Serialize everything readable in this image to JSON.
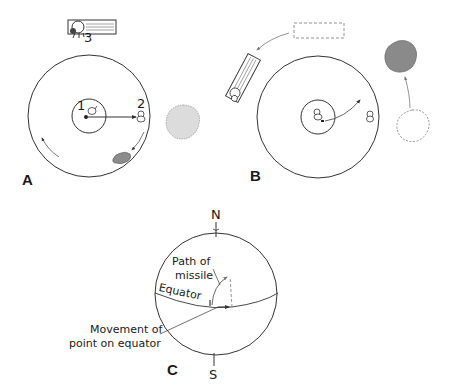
{
  "panels": {
    "A": {
      "label": "A",
      "markers": [
        "1",
        "2",
        "3"
      ]
    },
    "B": {
      "label": "B"
    },
    "C": {
      "label": "C",
      "north": "N",
      "south": "S",
      "equator": "Equator",
      "path_label_line1": "Path of",
      "path_label_line2": "missile",
      "movement_line1": "Movement of",
      "movement_line2": "point on equator"
    }
  },
  "colors": {
    "line": "#333333",
    "light_gray": "#d9d9d9",
    "dark_gray": "#8c8c8c",
    "dash": "#666666"
  }
}
